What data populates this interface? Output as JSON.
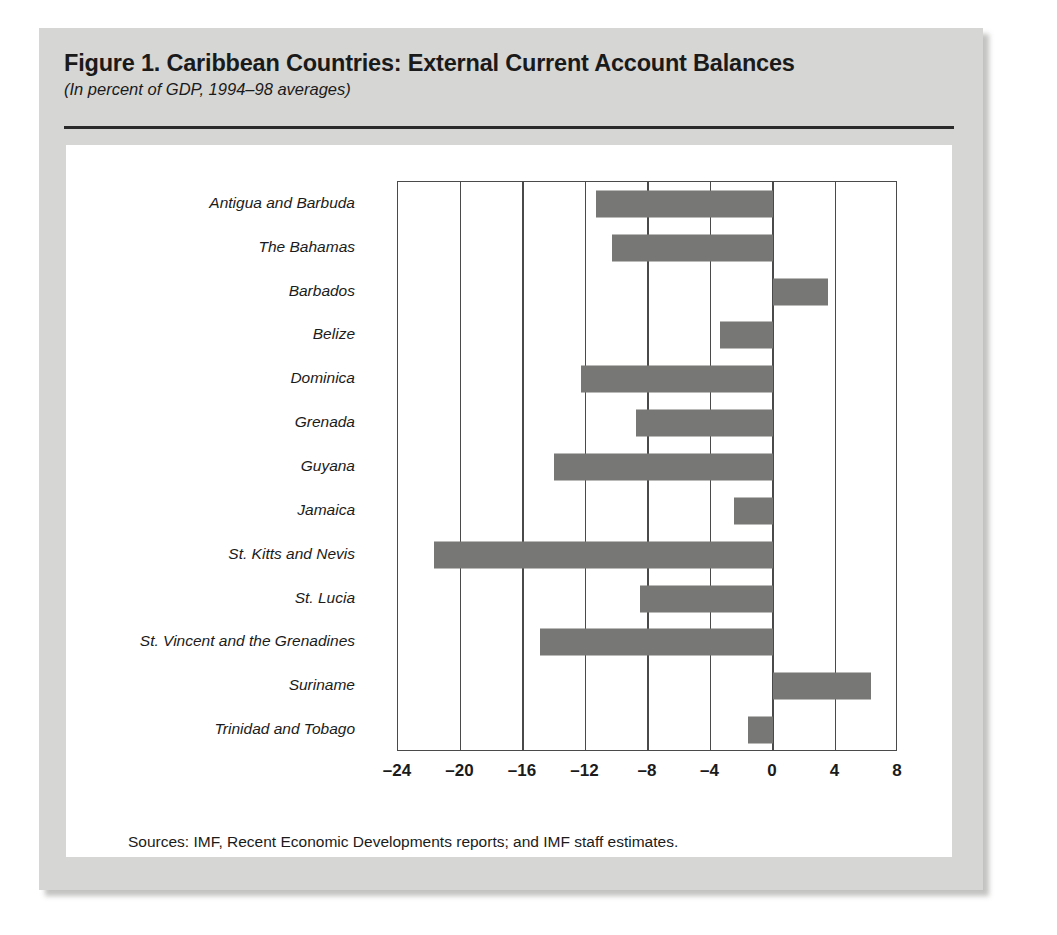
{
  "figure": {
    "title": "Figure 1.  Caribbean Countries: External Current Account Balances",
    "subtitle": "(In percent of GDP, 1994–98 averages)",
    "source_note": "Sources: IMF, Recent Economic Developments reports; and IMF staff estimates."
  },
  "colors": {
    "bar_fill": "#777775",
    "axis": "#4a4a4a",
    "card_background": "#d6d6d4",
    "panel_background": "#ffffff",
    "text": "#1b1b1b"
  },
  "chart_data": {
    "type": "bar",
    "orientation": "horizontal",
    "title": "Figure 1.  Caribbean Countries: External Current Account Balances",
    "subtitle": "(In percent of GDP, 1994–98 averages)",
    "xlabel": "",
    "ylabel": "",
    "xlim": [
      -24,
      8
    ],
    "xticks": [
      -24,
      -20,
      -16,
      -12,
      -8,
      -4,
      0,
      4,
      8
    ],
    "xticklabels": [
      "–24",
      "–20",
      "–16",
      "–12",
      "–8",
      "–4",
      "0",
      "4",
      "8"
    ],
    "grid": "vertical",
    "legend": "none",
    "categories": [
      "Antigua and Barbuda",
      "The Bahamas",
      "Barbados",
      "Belize",
      "Dominica",
      "Grenada",
      "Guyana",
      "Jamaica",
      "St. Kitts and Nevis",
      "St. Lucia",
      "St. Vincent and the Grenadines",
      "Suriname",
      "Trinidad and Tobago"
    ],
    "values": [
      -11.3,
      -10.3,
      3.5,
      -3.4,
      -12.3,
      -8.8,
      -14.0,
      -2.5,
      -21.7,
      -8.5,
      -14.9,
      6.3,
      -1.6
    ]
  }
}
